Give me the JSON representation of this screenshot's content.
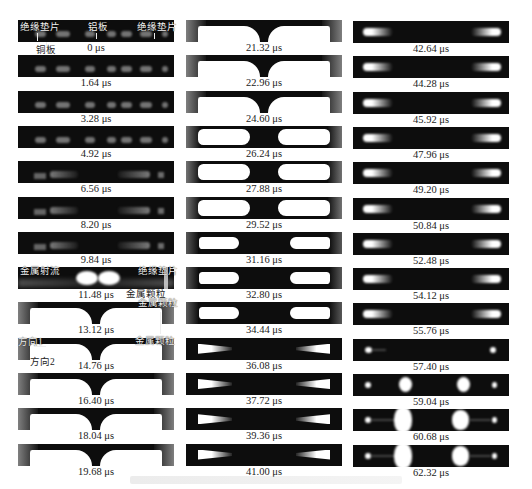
{
  "figure": {
    "columns": [
      {
        "frames": [
          {
            "time": "0 μs",
            "stage": "initial"
          },
          {
            "time": "1.64 μs",
            "stage": "early"
          },
          {
            "time": "3.28 μs",
            "stage": "early"
          },
          {
            "time": "4.92 μs",
            "stage": "early"
          },
          {
            "time": "6.56 μs",
            "stage": "early2"
          },
          {
            "time": "8.20 μs",
            "stage": "early2"
          },
          {
            "time": "9.84 μs",
            "stage": "early2"
          },
          {
            "time": "11.48 μs",
            "stage": "jet"
          },
          {
            "time": "13.12 μs",
            "stage": "bright"
          },
          {
            "time": "14.76 μs",
            "stage": "bright"
          },
          {
            "time": "16.40 μs",
            "stage": "bright"
          },
          {
            "time": "18.04 μs",
            "stage": "bright"
          },
          {
            "time": "19.68 μs",
            "stage": "bright"
          }
        ]
      },
      {
        "frames": [
          {
            "time": "21.32 μs",
            "stage": "bright"
          },
          {
            "time": "22.96 μs",
            "stage": "bright"
          },
          {
            "time": "24.60 μs",
            "stage": "bright"
          },
          {
            "time": "26.24 μs",
            "stage": "bright2"
          },
          {
            "time": "27.88 μs",
            "stage": "bright2"
          },
          {
            "time": "29.52 μs",
            "stage": "bright2"
          },
          {
            "time": "31.16 μs",
            "stage": "bright3"
          },
          {
            "time": "32.80 μs",
            "stage": "bright3"
          },
          {
            "time": "34.44 μs",
            "stage": "bright3"
          },
          {
            "time": "36.08 μs",
            "stage": "taper"
          },
          {
            "time": "37.72 μs",
            "stage": "taper"
          },
          {
            "time": "39.36 μs",
            "stage": "taper"
          },
          {
            "time": "41.00 μs",
            "stage": "taper"
          }
        ]
      },
      {
        "frames": [
          {
            "time": "42.64 μs",
            "stage": "dim"
          },
          {
            "time": "44.28 μs",
            "stage": "dim"
          },
          {
            "time": "45.92 μs",
            "stage": "dim"
          },
          {
            "time": "47.96 μs",
            "stage": "dim"
          },
          {
            "time": "49.20 μs",
            "stage": "dim"
          },
          {
            "time": "50.84 μs",
            "stage": "dim"
          },
          {
            "time": "52.48 μs",
            "stage": "dim"
          },
          {
            "time": "54.12 μs",
            "stage": "dim"
          },
          {
            "time": "55.76 μs",
            "stage": "dim"
          },
          {
            "time": "57.40 μs",
            "stage": "dots"
          },
          {
            "time": "59.04 μs",
            "stage": "burst1"
          },
          {
            "time": "60.68 μs",
            "stage": "burst2"
          },
          {
            "time": "62.32 μs",
            "stage": "burst2"
          }
        ]
      }
    ],
    "annotations": {
      "insulating_pad_left": "绝缘垫片",
      "aluminum_plate": "铝板",
      "insulating_pad_right": "绝缘垫片",
      "copper_plate": "铜板",
      "metal_jet": "金属射流",
      "insulating_pad_r2": "绝缘垫片",
      "metal_particles_1": "金属颗粒",
      "metal_particles_2": "金属颗粒",
      "metal_particles_3": "金属颗粒",
      "direction_1": "方向1",
      "direction_2": "方向2"
    },
    "caption": ""
  }
}
